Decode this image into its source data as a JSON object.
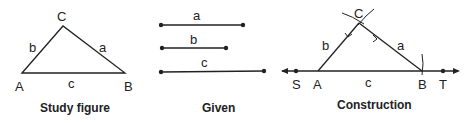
{
  "panels": {
    "study": {
      "caption": "Study figure",
      "vertices": {
        "A": "A",
        "B": "B",
        "C": "C"
      },
      "sides": {
        "a": "a",
        "b": "b",
        "c": "c"
      }
    },
    "given": {
      "caption": "Given",
      "segments": [
        {
          "label": "a"
        },
        {
          "label": "b"
        },
        {
          "label": "c"
        }
      ]
    },
    "construction": {
      "caption": "Construction",
      "points": {
        "S": "S",
        "A": "A",
        "B": "B",
        "T": "T",
        "C": "C"
      },
      "sides": {
        "a": "a",
        "b": "b",
        "c": "c"
      }
    }
  },
  "colors": {
    "ink": "#222222",
    "background": "#ffffff"
  }
}
